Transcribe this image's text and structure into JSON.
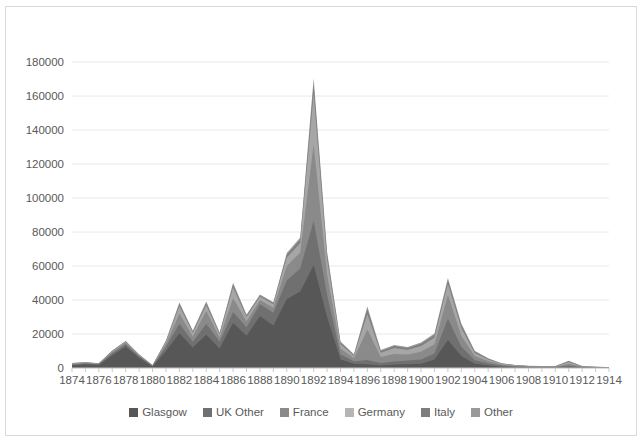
{
  "chart_data": {
    "type": "area",
    "stacked": true,
    "title": "",
    "subtitle": "",
    "xlabel": "",
    "ylabel": "",
    "grid": true,
    "legend_position": "bottom",
    "ylim": [
      0,
      180000
    ],
    "ytick_step": 20000,
    "ytick_labels": [
      "0",
      "20000",
      "40000",
      "60000",
      "80000",
      "100000",
      "120000",
      "140000",
      "160000",
      "180000"
    ],
    "xlim": [
      1874,
      1914
    ],
    "xtick_labels": [
      "1874",
      "1876",
      "1878",
      "1880",
      "1882",
      "1884",
      "1886",
      "1888",
      "1890",
      "1892",
      "1894",
      "1896",
      "1898",
      "1900",
      "1902",
      "1904",
      "1906",
      "1908",
      "1910",
      "1912",
      "1914"
    ],
    "x": [
      1874,
      1875,
      1876,
      1877,
      1878,
      1879,
      1880,
      1881,
      1882,
      1883,
      1884,
      1885,
      1886,
      1887,
      1888,
      1889,
      1890,
      1891,
      1892,
      1893,
      1894,
      1895,
      1896,
      1897,
      1898,
      1899,
      1900,
      1901,
      1902,
      1903,
      1904,
      1905,
      1906,
      1907,
      1908,
      1909,
      1910,
      1911,
      1912,
      1913,
      1914
    ],
    "series": [
      {
        "name": "Glasgow",
        "color": "#575757",
        "values": [
          1500,
          2200,
          1800,
          7500,
          12500,
          6000,
          900,
          10000,
          20500,
          12000,
          19500,
          11500,
          26500,
          19000,
          30500,
          25000,
          40500,
          45000,
          60500,
          30000,
          5000,
          2500,
          2200,
          1500,
          2000,
          2200,
          2500,
          5000,
          16500,
          7000,
          2500,
          1500,
          800,
          500,
          400,
          300,
          300,
          400,
          300,
          200,
          150
        ]
      },
      {
        "name": "UK Other",
        "color": "#707070",
        "values": [
          600,
          500,
          400,
          1200,
          1500,
          900,
          300,
          2500,
          5500,
          3500,
          6500,
          4000,
          6500,
          5000,
          7000,
          7500,
          11000,
          13500,
          26000,
          13000,
          3000,
          1500,
          2500,
          1500,
          1800,
          2200,
          2500,
          3500,
          12500,
          5500,
          2000,
          1200,
          600,
          400,
          300,
          250,
          250,
          900,
          250,
          180,
          120
        ]
      },
      {
        "name": "France",
        "color": "#8a8a8a",
        "values": [
          400,
          300,
          250,
          700,
          900,
          500,
          200,
          1800,
          6000,
          3000,
          7500,
          2500,
          8000,
          3500,
          2500,
          3000,
          8500,
          9500,
          45000,
          12000,
          3500,
          1800,
          18000,
          3500,
          4500,
          3500,
          4500,
          5500,
          14000,
          6500,
          2500,
          1400,
          600,
          350,
          250,
          220,
          220,
          1200,
          220,
          150,
          100
        ]
      },
      {
        "name": "Germany",
        "color": "#a6a6a6",
        "values": [
          300,
          250,
          200,
          500,
          600,
          350,
          150,
          1200,
          4500,
          2200,
          3500,
          1800,
          6500,
          2500,
          2000,
          2000,
          5000,
          5500,
          30000,
          9000,
          2500,
          1400,
          9000,
          2500,
          3500,
          2800,
          3500,
          4000,
          6500,
          4500,
          1800,
          900,
          450,
          300,
          200,
          180,
          180,
          1000,
          180,
          120,
          80
        ]
      },
      {
        "name": "Italy",
        "color": "#7d7d7d",
        "values": [
          120,
          100,
          80,
          200,
          250,
          150,
          80,
          400,
          1200,
          700,
          1200,
          600,
          1500,
          800,
          700,
          700,
          1500,
          1800,
          5000,
          2500,
          900,
          500,
          2500,
          900,
          1000,
          900,
          1100,
          1300,
          2000,
          1500,
          700,
          400,
          200,
          150,
          100,
          90,
          90,
          400,
          90,
          60,
          40
        ]
      },
      {
        "name": "Other",
        "color": "#999999",
        "values": [
          80,
          60,
          50,
          150,
          180,
          100,
          50,
          300,
          900,
          500,
          900,
          450,
          1200,
          600,
          500,
          500,
          1200,
          1400,
          4000,
          2000,
          700,
          400,
          2000,
          700,
          800,
          700,
          900,
          1000,
          1500,
          1200,
          600,
          300,
          180,
          120,
          80,
          70,
          70,
          300,
          70,
          50,
          30
        ]
      }
    ]
  },
  "legend": {
    "items": [
      {
        "label": "Glasgow",
        "color": "#575757"
      },
      {
        "label": "UK Other",
        "color": "#707070"
      },
      {
        "label": "France",
        "color": "#8a8a8a"
      },
      {
        "label": "Germany",
        "color": "#b5b5b5"
      },
      {
        "label": "Italy",
        "color": "#7d7d7d"
      },
      {
        "label": "Other",
        "color": "#999999"
      }
    ]
  }
}
